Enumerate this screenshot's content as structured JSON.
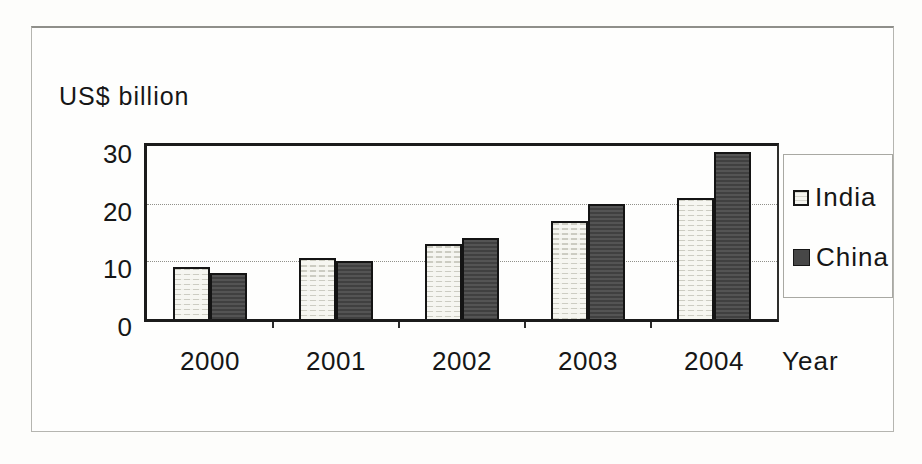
{
  "chart_data": {
    "type": "bar",
    "ylabel": "US$ billion",
    "xlabel": "Year",
    "categories": [
      "2000",
      "2001",
      "2002",
      "2003",
      "2004"
    ],
    "series": [
      {
        "name": "India",
        "values": [
          9,
          10.5,
          13,
          17,
          21
        ],
        "swatch": "light-striped"
      },
      {
        "name": "China",
        "values": [
          8,
          10,
          14,
          20,
          29
        ],
        "swatch": "dark-gray"
      }
    ],
    "yticks": [
      0,
      10,
      20,
      30
    ],
    "ylim": [
      0,
      30
    ],
    "grid": "horizontal-dotted",
    "legend_position": "right"
  },
  "colors": {
    "china_fill": "#474747",
    "india_base": "#f6f6f1",
    "india_stripe": "#ccccc2",
    "axis": "#1b1b1b",
    "grid_line": "#90908a",
    "panel_border": "#b5b5b0"
  }
}
